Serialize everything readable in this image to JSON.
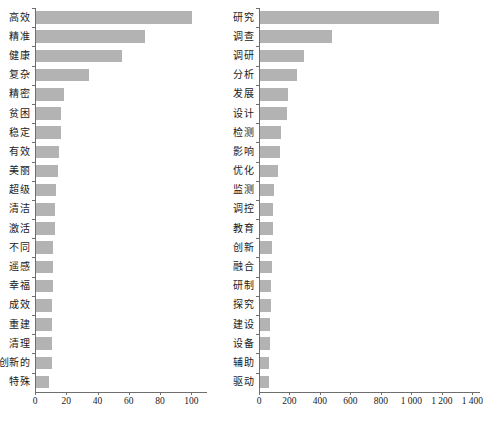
{
  "figure": {
    "background_color": "#ffffff",
    "bar_color": "#b3b3b3",
    "axis_color": "#6e6e6e",
    "text_color": "#1a1a1a"
  },
  "chart_data": [
    {
      "id": "left",
      "type": "bar",
      "orientation": "horizontal",
      "title": "",
      "xlabel": "",
      "ylabel": "",
      "xlim": [
        0,
        110
      ],
      "grid": false,
      "legend": null,
      "xticks": [
        0,
        20,
        40,
        60,
        80,
        100
      ],
      "xtick_labels": [
        "0",
        "20",
        "40",
        "60",
        "80",
        "100"
      ],
      "categories": [
        "高效",
        "精准",
        "健康",
        "复杂",
        "精密",
        "贫困",
        "稳定",
        "有效",
        "美丽",
        "超级",
        "清洁",
        "激活",
        "不同",
        "遥感",
        "幸福",
        "成效",
        "重建",
        "清理",
        "创新的",
        "特殊"
      ],
      "values": [
        100,
        70,
        55,
        34,
        18,
        16,
        16,
        15,
        14,
        13,
        12,
        12,
        11,
        11,
        11,
        10,
        10,
        10,
        10,
        8
      ]
    },
    {
      "id": "right",
      "type": "bar",
      "orientation": "horizontal",
      "title": "",
      "xlabel": "",
      "ylabel": "",
      "xlim": [
        0,
        1450
      ],
      "grid": false,
      "legend": null,
      "xticks": [
        0,
        200,
        400,
        600,
        800,
        1000,
        1200,
        1400
      ],
      "xtick_labels": [
        "0",
        "200",
        "400",
        "600",
        "800",
        "1 000",
        "1 200",
        "1 400"
      ],
      "categories": [
        "研究",
        "调查",
        "调研",
        "分析",
        "发展",
        "设计",
        "检测",
        "影响",
        "优化",
        "监测",
        "调控",
        "教育",
        "创新",
        "融合",
        "研制",
        "探究",
        "建设",
        "设备",
        "辅助",
        "驱动"
      ],
      "values": [
        1175,
        470,
        290,
        245,
        185,
        180,
        135,
        130,
        120,
        90,
        85,
        85,
        80,
        80,
        75,
        70,
        65,
        65,
        60,
        60
      ]
    }
  ]
}
